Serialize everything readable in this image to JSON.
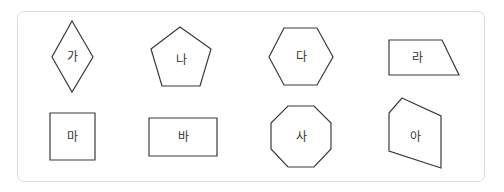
{
  "shapes": [
    {
      "id": "ga",
      "label": "가",
      "type": "rhombus",
      "points": "72,21 93,57 72,92 52,57",
      "center": [
        72,
        57
      ]
    },
    {
      "id": "na",
      "label": "나",
      "type": "pentagon",
      "points": "180,27 211,49 200,86 162,86 151,49",
      "center": [
        181,
        60
      ]
    },
    {
      "id": "da",
      "label": "다",
      "type": "hexagon",
      "points": "284,28 317,28 333,57 317,85 284,85 269,57",
      "center": [
        301,
        57
      ]
    },
    {
      "id": "ra",
      "label": "라",
      "type": "trapezoid",
      "points": "389,40 442,40 459,75 389,75",
      "center": [
        417,
        58
      ]
    },
    {
      "id": "ma",
      "label": "마",
      "type": "square",
      "points": "50,113 95,113 95,160 50,160",
      "center": [
        72,
        137
      ]
    },
    {
      "id": "ba",
      "label": "바",
      "type": "rectangle",
      "points": "149,118 217,118 217,156 149,156",
      "center": [
        183,
        137
      ]
    },
    {
      "id": "sa",
      "label": "사",
      "type": "octagon",
      "points": "288,106 314,106 331,123 331,149 314,167 288,167 271,149 271,123",
      "center": [
        301,
        137
      ]
    },
    {
      "id": "a",
      "label": "아",
      "type": "irregular-pentagon",
      "points": "402,98 441,116 441,168 389,151 389,113",
      "center": [
        415,
        137
      ]
    }
  ]
}
